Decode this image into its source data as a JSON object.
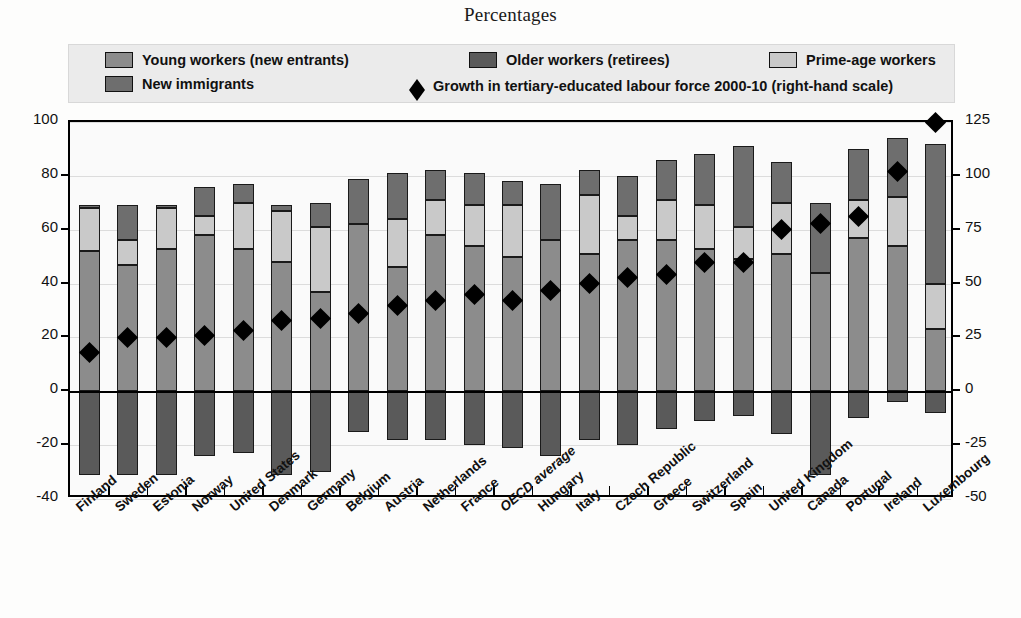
{
  "title": "Percentages",
  "legend": {
    "items": [
      {
        "label": "Young workers (new entrants)",
        "color": "#8c8c8c",
        "type": "swatch",
        "name": "legend-young-workers"
      },
      {
        "label": "Older workers (retirees)",
        "color": "#5a5a5a",
        "type": "swatch",
        "name": "legend-older-workers"
      },
      {
        "label": "Prime-age workers",
        "color": "#c9c9c9",
        "type": "swatch",
        "name": "legend-prime-age-workers"
      },
      {
        "label": "New immigrants",
        "color": "#6e6e6e",
        "type": "swatch",
        "name": "legend-new-immigrants"
      },
      {
        "label": "Growth in tertiary-educated labour force 2000-10 (right-hand scale)",
        "color": "#000000",
        "type": "diamond",
        "name": "legend-growth-tertiary"
      }
    ]
  },
  "chart_data": {
    "type": "bar",
    "title": "Percentages",
    "xlabel": "",
    "ylabel": "",
    "ylim": [
      -40,
      100
    ],
    "ylim_right": [
      -50,
      125
    ],
    "yticks": [
      100,
      80,
      60,
      40,
      20,
      0,
      -20,
      -40
    ],
    "yticks_right": [
      125,
      100,
      75,
      50,
      25,
      0,
      -25,
      -50
    ],
    "grid": true,
    "legend_position": "top",
    "stacked": true,
    "categories": [
      "Finland",
      "Sweden",
      "Estonia",
      "Norway",
      "United States",
      "Denmark",
      "Germany",
      "Belgium",
      "Austria",
      "Netherlands",
      "France",
      "OECD average",
      "Hungary",
      "Italy",
      "Czech Republic",
      "Greece",
      "Switzerland",
      "Spain",
      "United Kingdom",
      "Canada",
      "Portugal",
      "Ireland",
      "Luxembourg"
    ],
    "series": [
      {
        "name": "Young workers (new entrants)",
        "color": "#8c8c8c",
        "values": [
          52,
          47,
          53,
          58,
          53,
          48,
          37,
          62,
          46,
          58,
          54,
          50,
          56,
          51,
          56,
          56,
          53,
          49,
          51,
          44,
          57,
          54,
          23
        ]
      },
      {
        "name": "Prime-age workers",
        "color": "#c9c9c9",
        "values": [
          16,
          9,
          15,
          7,
          17,
          19,
          24,
          0,
          18,
          13,
          15,
          19,
          0,
          22,
          9,
          15,
          16,
          12,
          19,
          0,
          14,
          18,
          17
        ]
      },
      {
        "name": "New immigrants",
        "color": "#6e6e6e",
        "values": [
          1,
          13,
          1,
          11,
          7,
          2,
          9,
          17,
          17,
          11,
          12,
          9,
          21,
          9,
          15,
          15,
          19,
          30,
          15,
          26,
          19,
          22,
          52
        ]
      },
      {
        "name": "Older workers (retirees)",
        "color": "#5a5a5a",
        "values": [
          -31,
          -31,
          -31,
          -24,
          -23,
          -31,
          -30,
          -15,
          -18,
          -18,
          -20,
          -21,
          -24,
          -18,
          -20,
          -14,
          -11,
          -9,
          -16,
          -31,
          -10,
          -4,
          -8
        ]
      }
    ],
    "markers": {
      "name": "Growth in tertiary-educated labour force 2000-10 (right-hand scale)",
      "color": "#000000",
      "scale": "right",
      "values": [
        18,
        25,
        25,
        26,
        28,
        33,
        34,
        36,
        40,
        42,
        45,
        42,
        47,
        50,
        53,
        54,
        60,
        60,
        75,
        78,
        81,
        102,
        125
      ]
    }
  },
  "axes": {
    "left_ticks": [
      "100",
      "80",
      "60",
      "40",
      "20",
      "0",
      "-20",
      "-40"
    ],
    "right_ticks": [
      "125",
      "100",
      "75",
      "50",
      "25",
      "0",
      "-25",
      "-50"
    ]
  }
}
